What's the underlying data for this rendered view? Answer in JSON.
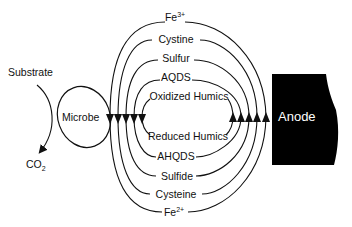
{
  "diagram": {
    "left": {
      "substrate_label": "Substrate",
      "co2_label": "CO",
      "co2_subscript": "2",
      "microbe_label": "Microbe"
    },
    "anode": {
      "label": "Anode",
      "fill": "#000000"
    },
    "oxidized_shuttles": [
      {
        "label": "Fe",
        "sup": "3+"
      },
      {
        "label": "Cystine"
      },
      {
        "label": "Sulfur"
      },
      {
        "label": "AQDS"
      },
      {
        "label": "Oxidized Humics"
      }
    ],
    "reduced_shuttles": [
      {
        "label": "Reduced Humics"
      },
      {
        "label": "AHQDS"
      },
      {
        "label": "Sulfide"
      },
      {
        "label": "Cysteine"
      },
      {
        "label": "Fe",
        "sup": "2+"
      }
    ]
  }
}
